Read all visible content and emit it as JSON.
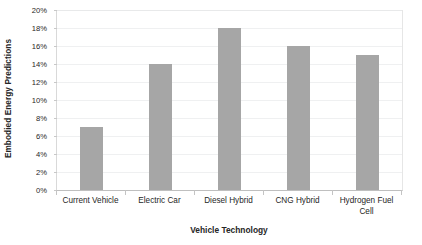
{
  "chart_data": {
    "type": "bar",
    "title": "",
    "xlabel": "Vehicle Technology",
    "ylabel": "Embodied Energy Predictions",
    "categories": [
      "Current Vehicle",
      "Electric Car",
      "Diesel Hybrid",
      "CNG Hybrid",
      "Hydrogen Fuel Cell"
    ],
    "values": [
      7,
      14,
      18,
      16,
      15
    ],
    "value_labels": [
      "7%",
      "14%",
      "18%",
      "16%",
      "15%"
    ],
    "ylim": [
      0,
      20
    ],
    "ytick_values": [
      0,
      2,
      4,
      6,
      8,
      10,
      12,
      14,
      16,
      18,
      20
    ],
    "ytick_labels": [
      "0%",
      "2%",
      "4%",
      "6%",
      "8%",
      "10%",
      "12%",
      "14%",
      "16%",
      "18%",
      "20%"
    ],
    "grid": true,
    "legend": false,
    "legend_position": "none",
    "bar_color": "#a6a6a6",
    "gridline_color": "#eff0f1",
    "axis_color": "#bfbfbf",
    "text_color": "#262626",
    "background": "#ffffff"
  }
}
